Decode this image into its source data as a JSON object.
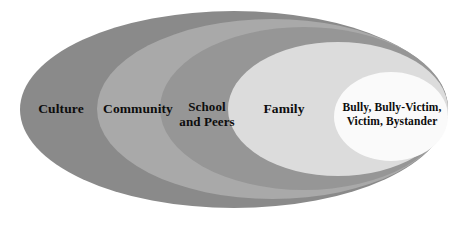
{
  "diagram": {
    "type": "nested-ellipse",
    "layers": [
      {
        "id": "culture",
        "label": "Culture",
        "color": "#8a8a8a",
        "level": 1,
        "geometry": {
          "left": 20,
          "top": 11,
          "width": 428,
          "height": 197
        }
      },
      {
        "id": "community",
        "label": "Community",
        "color": "#a9a9a9",
        "level": 2,
        "geometry": {
          "left": 97,
          "top": 19,
          "width": 351,
          "height": 180
        }
      },
      {
        "id": "school-and-peers",
        "label": "School\nand Peers",
        "color": "#969696",
        "level": 3,
        "geometry": {
          "left": 160,
          "top": 27,
          "width": 288,
          "height": 163
        }
      },
      {
        "id": "family",
        "label": "Family",
        "color": "#dcdcdc",
        "level": 4,
        "geometry": {
          "left": 228,
          "top": 42,
          "width": 220,
          "height": 134
        }
      },
      {
        "id": "core-roles",
        "label": "Bully, Bully-Victim,\nVictim, Bystander",
        "color": "#fafafa",
        "level": 5,
        "geometry": {
          "left": 334,
          "top": 72,
          "width": 114,
          "height": 89
        }
      }
    ],
    "background_color": "#ffffff",
    "text_color": "#0d0d0d"
  }
}
